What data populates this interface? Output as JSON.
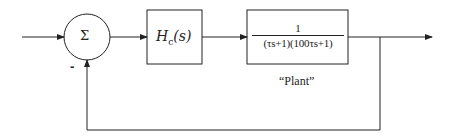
{
  "diagram": {
    "type": "feedback-control-block-diagram",
    "summing_junction": {
      "symbol": "Σ",
      "feedback_sign": "-"
    },
    "controller": {
      "label_main": "H",
      "label_sub": "c",
      "label_arg": "(s)"
    },
    "plant": {
      "numerator": "1",
      "denominator": "(τs+1)(100τs+1)",
      "caption": "“Plant”"
    },
    "colors": {
      "stroke": "#222222",
      "background": "#ffffff"
    }
  }
}
